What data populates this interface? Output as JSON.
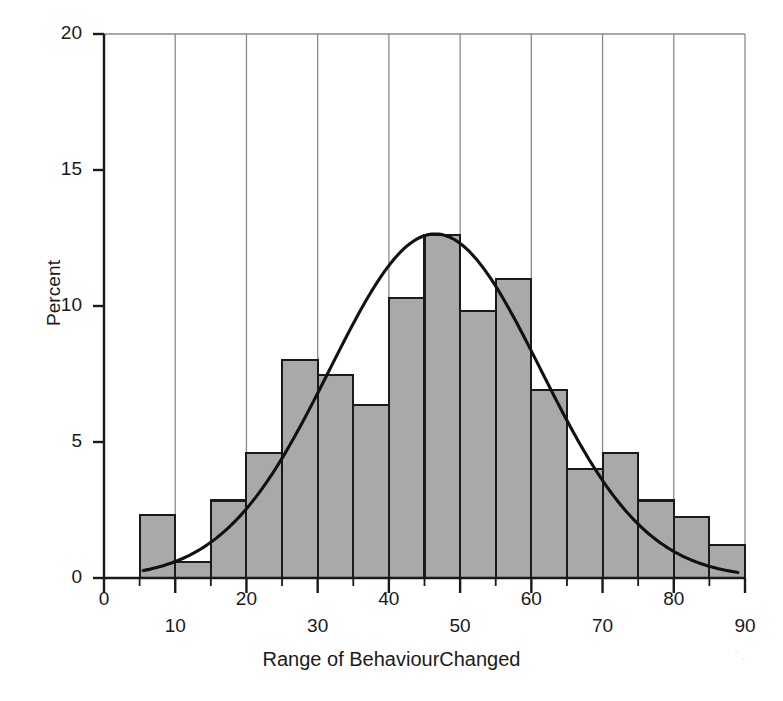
{
  "chart_data": {
    "type": "bar",
    "title": "",
    "subtitle": "",
    "xlabel": "Range of BehaviourChanged",
    "ylabel": "Percent",
    "xlim": [
      0,
      90
    ],
    "ylim": [
      0,
      20
    ],
    "grid": "vertical",
    "legend": "none",
    "x_major_ticks": [
      0,
      10,
      20,
      30,
      40,
      50,
      60,
      70,
      80,
      90
    ],
    "x_tick_labels_upper": [
      "0",
      "20",
      "40",
      "60",
      "80"
    ],
    "x_tick_labels_lower": [
      "10",
      "30",
      "50",
      "70",
      "90"
    ],
    "x_tick_labels_upper_values": [
      0,
      20,
      40,
      60,
      80
    ],
    "x_tick_labels_lower_values": [
      10,
      30,
      50,
      70,
      90
    ],
    "y_ticks": [
      0,
      5,
      10,
      15,
      20
    ],
    "y_tick_labels": [
      "0",
      "5",
      "10",
      "15",
      "20"
    ],
    "bin_width": 5,
    "bin_edges": [
      5,
      10,
      15,
      20,
      25,
      30,
      35,
      40,
      45,
      50,
      55,
      60,
      65,
      70,
      75,
      80,
      85,
      90
    ],
    "bar_series_name": "Percent of observations",
    "values": [
      2.3,
      0.6,
      2.85,
      4.6,
      8.0,
      7.45,
      6.35,
      10.3,
      12.6,
      9.8,
      11.0,
      6.9,
      4.0,
      4.6,
      2.85,
      2.25,
      1.2,
      0.6,
      1.2,
      0.6
    ],
    "bins": [
      {
        "from": 5,
        "to": 10,
        "value": 2.3
      },
      {
        "from": 10,
        "to": 15,
        "value": 0.6
      },
      {
        "from": 15,
        "to": 20,
        "value": 2.85
      },
      {
        "from": 20,
        "to": 25,
        "value": 4.6
      },
      {
        "from": 25,
        "to": 30,
        "value": 8.0
      },
      {
        "from": 30,
        "to": 35,
        "value": 7.45
      },
      {
        "from": 35,
        "to": 40,
        "value": 6.35
      },
      {
        "from": 40,
        "to": 45,
        "value": 10.3
      },
      {
        "from": 45,
        "to": 50,
        "value": 12.6
      },
      {
        "from": 50,
        "to": 55,
        "value": 9.8
      },
      {
        "from": 55,
        "to": 60,
        "value": 11.0
      },
      {
        "from": 60,
        "to": 65,
        "value": 6.9
      },
      {
        "from": 65,
        "to": 70,
        "value": 4.0
      },
      {
        "from": 70,
        "to": 75,
        "value": 4.6
      },
      {
        "from": 75,
        "to": 80,
        "value": 2.85
      },
      {
        "from": 80,
        "to": 85,
        "value": 2.25
      },
      {
        "from": 85,
        "to": 90,
        "value": 1.2
      },
      {
        "from": 90,
        "to": 95,
        "value": 0.6
      },
      {
        "from": 95,
        "to": 100,
        "value": 1.2
      },
      {
        "from": 100,
        "to": 105,
        "value": 0.6
      }
    ],
    "overlay_curve": {
      "name": "normal-density-fit",
      "kind": "normal",
      "mean": 46.5,
      "sd": 14.8,
      "peak_value": 12.65,
      "description": "fitted normal distribution curve"
    },
    "colors": {
      "bar_fill": "#a9a9a9",
      "bar_edge": "#1a1a1a",
      "curve": "#111111",
      "gridline": "#8a8a8a",
      "axis": "#1a1a1a",
      "background": "#ffffff",
      "text": "#1a1a1a"
    }
  },
  "artifact": {
    "scan_mark": "' ,"
  }
}
